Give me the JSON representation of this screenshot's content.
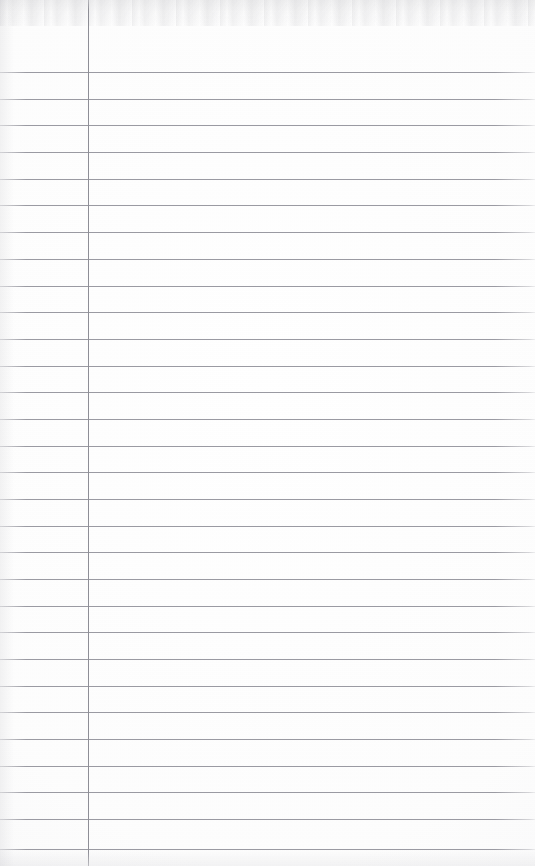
{
  "document": {
    "kind": "scanned-ruled-notebook-page",
    "title": "Blank ruled notebook page",
    "page_width": 535,
    "page_height": 866,
    "content_text": "",
    "has_handwriting": false,
    "has_printed_text": false
  },
  "colors": {
    "paper": "#fefefe",
    "paper_shade": "#f4f4f6",
    "rule_line": "#9a9aa2",
    "margin_line": "#8e8e96",
    "scan_artifact": "#96969c"
  },
  "margin_rule": {
    "name": "vertical-margin-line",
    "x": 88,
    "top": 0,
    "bottom": 866,
    "thickness": 1,
    "color": "#8e8e96"
  },
  "ruling": {
    "name": "horizontal-rule-lines",
    "count": 30,
    "first_line_y": 72,
    "spacing": 26.8,
    "thickness": 1,
    "color": "#9a9aa2",
    "left_x": 0,
    "right_x": 535,
    "lines_y": [
      72,
      98.5,
      125,
      151.5,
      178.5,
      205,
      232,
      258.5,
      285.5,
      312,
      338.5,
      365.5,
      392,
      418.5,
      445.5,
      472,
      498.5,
      525.5,
      552,
      578.5,
      605.5,
      632,
      658.5,
      685.5,
      712,
      738.5,
      765.5,
      792,
      818.5,
      849
    ]
  }
}
